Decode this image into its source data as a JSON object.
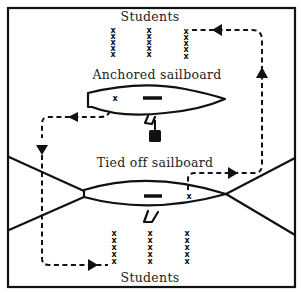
{
  "diagram": {
    "labels": {
      "students_top": "Students",
      "anchored": "Anchored sailboard",
      "tied_off": "Tied off sailboard",
      "students_bottom": "Students"
    },
    "student_mark": "x",
    "student_rows": {
      "top": {
        "columns": 3,
        "per_column": 5
      },
      "bottom": {
        "columns": 3,
        "per_column": 5
      }
    },
    "colors": {
      "ink": "#111111",
      "background": "#ffffff"
    }
  }
}
